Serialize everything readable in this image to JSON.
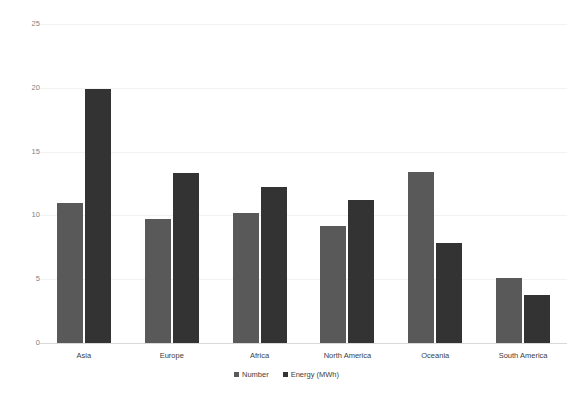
{
  "chart_data": {
    "type": "bar",
    "title": "",
    "subtitle": "",
    "xlabel": "",
    "ylabel": "",
    "categories": [
      "Asia",
      "Europe",
      "Africa",
      "North America",
      "Oceania",
      "South America"
    ],
    "series": [
      {
        "name": "Number",
        "color": "#595959",
        "values": [
          11.0,
          9.7,
          10.2,
          9.2,
          13.4,
          5.1
        ]
      },
      {
        "name": "Energy (MWh)",
        "color": "#333333",
        "values": [
          19.9,
          13.3,
          12.2,
          11.2,
          7.8,
          3.8
        ]
      }
    ],
    "ylim": [
      0,
      25
    ],
    "yticks": [
      0,
      5,
      10,
      15,
      20,
      25
    ],
    "ytick_labels": [
      "0",
      "5",
      "10",
      "15",
      "20",
      "25"
    ],
    "grid": true,
    "legend_position": "bottom",
    "annotations": []
  },
  "axis": {
    "tick_0": "0",
    "tick_5": "5",
    "tick_10": "10",
    "tick_15": "15",
    "tick_20": "20",
    "tick_25": "25"
  },
  "legend": {
    "items": [
      {
        "label": "Number"
      },
      {
        "label": "Energy (MWh)"
      }
    ]
  }
}
